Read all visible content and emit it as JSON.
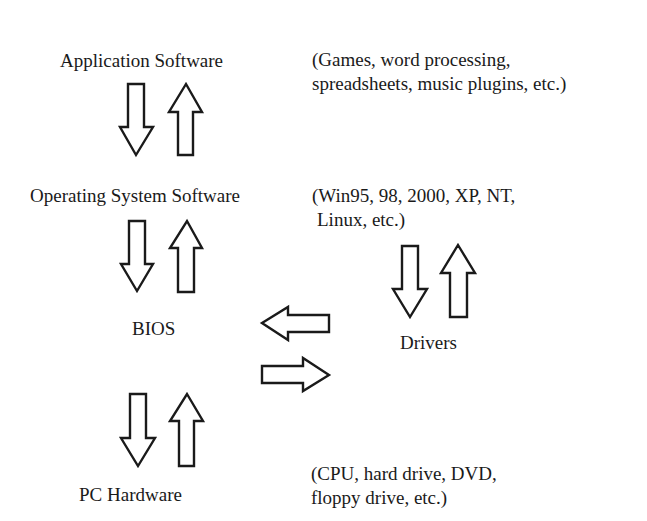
{
  "diagram": {
    "layers": [
      {
        "id": "application",
        "label": "Application Software",
        "note_lines": [
          "(Games, word processing,",
          "spreadsheets, music plugins, etc.)"
        ]
      },
      {
        "id": "os",
        "label": "Operating System Software",
        "note_lines": [
          "(Win95, 98, 2000, XP, NT,",
          "Linux, etc.)"
        ]
      },
      {
        "id": "bios",
        "label": "BIOS"
      },
      {
        "id": "drivers",
        "label": "Drivers"
      },
      {
        "id": "hardware",
        "label": "PC Hardware",
        "note_lines": [
          "(CPU, hard drive, DVD,",
          "floppy drive, etc.)"
        ]
      }
    ],
    "connections": [
      {
        "from": "Application Software",
        "to": "Operating System Software",
        "type": "bidirectional"
      },
      {
        "from": "Operating System Software",
        "to": "BIOS",
        "type": "bidirectional"
      },
      {
        "from": "Operating System Software",
        "to": "Drivers",
        "type": "bidirectional"
      },
      {
        "from": "Drivers",
        "to": "BIOS",
        "type": "bidirectional"
      },
      {
        "from": "BIOS",
        "to": "PC Hardware",
        "type": "bidirectional"
      }
    ],
    "colors": {
      "background": "#ffffff",
      "ink": "#1a1a1a"
    }
  }
}
